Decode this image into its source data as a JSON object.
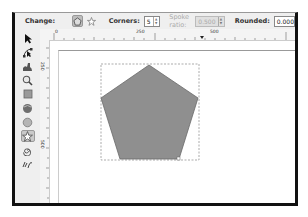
{
  "controls": {
    "change_label": "Change:",
    "mode_buttons": [
      {
        "name": "polygon",
        "icon": "polygon-icon",
        "active": true
      },
      {
        "name": "star",
        "icon": "star-icon",
        "active": false
      }
    ],
    "corners_label": "Corners:",
    "corners_value": "5",
    "spoke_ratio_label": "Spoke ratio:",
    "spoke_ratio_value": "0.500",
    "spoke_ratio_disabled": true,
    "rounded_label": "Rounded:",
    "rounded_value": "0.000"
  },
  "ruler": {
    "h_labels": [
      "0",
      "250",
      "500"
    ],
    "v_labels": [
      "250",
      "500"
    ]
  },
  "toolbox": {
    "tools": [
      {
        "name": "selector",
        "icon": "arrow-icon"
      },
      {
        "name": "node",
        "icon": "node-icon"
      },
      {
        "name": "tweak",
        "icon": "tweak-icon"
      },
      {
        "name": "zoom",
        "icon": "zoom-icon"
      },
      {
        "name": "rectangle",
        "icon": "rectangle-icon"
      },
      {
        "name": "3d-box",
        "icon": "box3d-icon"
      },
      {
        "name": "ellipse",
        "icon": "ellipse-icon"
      },
      {
        "name": "star-polygon",
        "icon": "star-icon",
        "active": true
      },
      {
        "name": "spiral",
        "icon": "spiral-icon"
      },
      {
        "name": "pencil",
        "icon": "pencil-icon"
      }
    ]
  },
  "canvas": {
    "shape": {
      "type": "pentagon",
      "fill": "#8f8f8f",
      "stroke": "#6a6a6a",
      "corners": 5
    },
    "selection": "dashed-bbox"
  },
  "colors": {
    "shape_fill": "#8f8f8f",
    "toolbar_bg": "#efefef",
    "frame": "#111111"
  }
}
